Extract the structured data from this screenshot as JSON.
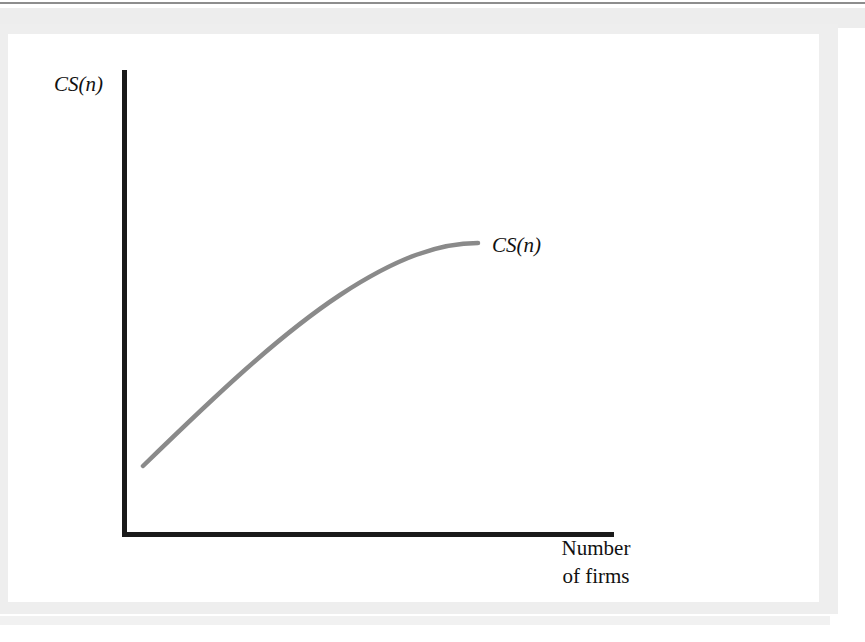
{
  "figure": {
    "axes": {
      "y_label": "CS(n)",
      "x_label_line1": "Number",
      "x_label_line2": "of firms"
    },
    "curve_label": "CS(n)",
    "colors": {
      "axis": "#1a1a1a",
      "curve": "#8a8a8a",
      "frame": "#eeeeee",
      "background": "#ffffff"
    }
  },
  "chart_data": {
    "type": "line",
    "title": "",
    "xlabel": "Number of firms",
    "ylabel": "CS(n)",
    "series": [
      {
        "name": "CS(n)",
        "x": [
          0.05,
          0.15,
          0.25,
          0.35,
          0.45,
          0.55,
          0.65,
          0.75,
          0.85,
          0.95
        ],
        "y": [
          0.15,
          0.27,
          0.38,
          0.48,
          0.57,
          0.64,
          0.7,
          0.75,
          0.79,
          0.82
        ]
      }
    ],
    "xlim": [
      0,
      1
    ],
    "ylim": [
      0,
      1
    ],
    "grid": false,
    "legend": false,
    "annotations": [
      "CS(n)"
    ],
    "axis_ticks": {
      "x": [],
      "y": []
    },
    "shape_note": "increasing concave function (diminishing returns)"
  }
}
